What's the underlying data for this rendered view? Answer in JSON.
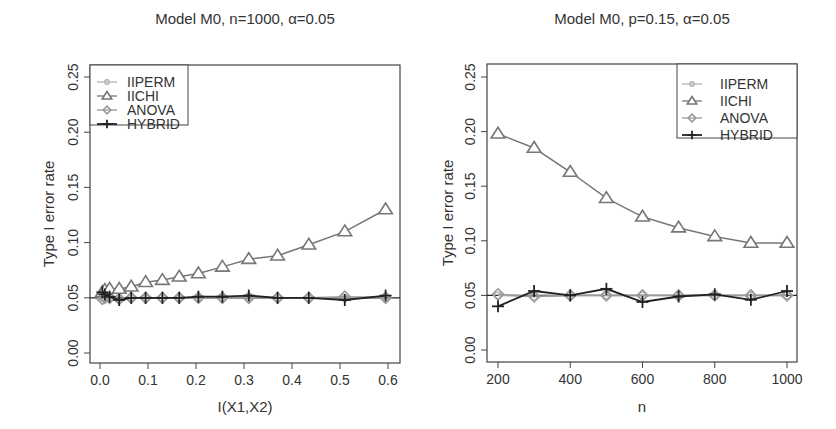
{
  "chart_data": [
    {
      "type": "line",
      "title": "Model M0, n=1000, α=0.05",
      "xlabel": "I(X1,X2)",
      "ylabel": "Type I error rate",
      "xlim": [
        -0.01,
        0.62
      ],
      "ylim": [
        -0.01,
        0.26
      ],
      "x_ticks": [
        "0.0",
        "0.1",
        "0.2",
        "0.3",
        "0.4",
        "0.5",
        "0.6"
      ],
      "y_ticks": [
        "0.00",
        "0.05",
        "0.10",
        "0.15",
        "0.20",
        "0.25"
      ],
      "reference_line": 0.05,
      "legend_position": "topleft",
      "x": [
        0.005,
        0.01,
        0.02,
        0.04,
        0.065,
        0.095,
        0.13,
        0.165,
        0.205,
        0.255,
        0.31,
        0.37,
        0.435,
        0.51,
        0.595
      ],
      "series": [
        {
          "name": "IIPERM",
          "marker": "circle",
          "color": "#b0b0b0",
          "values": [
            0.05,
            0.05,
            0.05,
            0.049,
            0.05,
            0.05,
            0.05,
            0.05,
            0.05,
            0.05,
            0.051,
            0.05,
            0.05,
            0.05,
            0.051
          ]
        },
        {
          "name": "IICHI",
          "marker": "triangle",
          "color": "#777777",
          "values": [
            0.055,
            0.057,
            0.058,
            0.058,
            0.06,
            0.064,
            0.066,
            0.069,
            0.072,
            0.078,
            0.085,
            0.088,
            0.098,
            0.11,
            0.13
          ]
        },
        {
          "name": "ANOVA",
          "marker": "diamond",
          "color": "#999999",
          "values": [
            0.049,
            0.05,
            0.05,
            0.049,
            0.05,
            0.05,
            0.05,
            0.05,
            0.05,
            0.05,
            0.05,
            0.05,
            0.05,
            0.051,
            0.05
          ]
        },
        {
          "name": "HYBRID",
          "marker": "plus",
          "color": "#222222",
          "values": [
            0.055,
            0.053,
            0.051,
            0.048,
            0.05,
            0.05,
            0.05,
            0.05,
            0.051,
            0.051,
            0.052,
            0.05,
            0.05,
            0.048,
            0.052
          ]
        }
      ]
    },
    {
      "type": "line",
      "title": "Model M0, p=0.15, α=0.05",
      "xlabel": "n",
      "ylabel": "Type I error rate",
      "xlim": [
        170,
        1030
      ],
      "ylim": [
        -0.01,
        0.26
      ],
      "x_ticks": [
        "200",
        "400",
        "600",
        "800",
        "1000"
      ],
      "y_ticks": [
        "0.00",
        "0.05",
        "0.10",
        "0.15",
        "0.20",
        "0.25"
      ],
      "reference_line": 0.05,
      "legend_position": "topright",
      "x": [
        200,
        300,
        400,
        500,
        600,
        700,
        800,
        900,
        1000
      ],
      "series": [
        {
          "name": "IIPERM",
          "marker": "circle",
          "color": "#b0b0b0",
          "values": [
            0.05,
            0.049,
            0.05,
            0.05,
            0.05,
            0.05,
            0.05,
            0.05,
            0.05
          ]
        },
        {
          "name": "IICHI",
          "marker": "triangle",
          "color": "#777777",
          "values": [
            0.198,
            0.185,
            0.163,
            0.139,
            0.122,
            0.112,
            0.104,
            0.098,
            0.098
          ]
        },
        {
          "name": "ANOVA",
          "marker": "diamond",
          "color": "#999999",
          "values": [
            0.051,
            0.049,
            0.05,
            0.05,
            0.05,
            0.05,
            0.05,
            0.05,
            0.05
          ]
        },
        {
          "name": "HYBRID",
          "marker": "plus",
          "color": "#222222",
          "values": [
            0.04,
            0.054,
            0.05,
            0.056,
            0.044,
            0.049,
            0.051,
            0.046,
            0.054
          ]
        }
      ]
    }
  ]
}
